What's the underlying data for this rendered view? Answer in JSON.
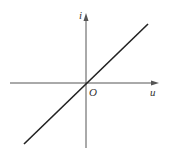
{
  "diagram": {
    "type": "linear-iv-characteristic",
    "axes": {
      "x_label": "u",
      "y_label": "i",
      "origin_label": "O"
    },
    "colors": {
      "axis": "#555555",
      "curve": "#222222",
      "background": "#ffffff"
    },
    "geometry": {
      "origin": [
        86,
        83
      ],
      "x_axis": {
        "from": [
          10,
          83
        ],
        "to": [
          158,
          83
        ]
      },
      "y_axis": {
        "from": [
          86,
          148
        ],
        "to": [
          86,
          14
        ]
      },
      "curve": {
        "from": [
          24,
          144
        ],
        "to": [
          148,
          24
        ]
      }
    }
  }
}
